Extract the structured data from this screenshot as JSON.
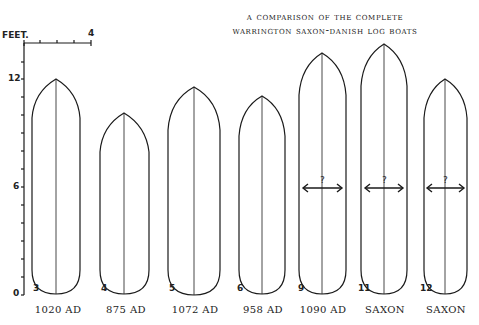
{
  "title": {
    "line1": "A Comparison of the Complete",
    "line2": "Warrington Saxon-Danish Log Boats"
  },
  "scale_bar": {
    "unit_label": "FEET.",
    "end_label": "4",
    "ticks": [
      0,
      1,
      2,
      3,
      4
    ]
  },
  "y_axis": {
    "labels": [
      "12",
      "6",
      "0"
    ],
    "unit": "feet",
    "range": [
      0,
      12
    ]
  },
  "boats": [
    {
      "number": "3",
      "date": "1020 AD",
      "length_ft": 12.0,
      "beam_known": true
    },
    {
      "number": "4",
      "date": "875 AD",
      "length_ft": 10.1,
      "beam_known": true
    },
    {
      "number": "5",
      "date": "1072 AD",
      "length_ft": 11.5,
      "beam_known": true
    },
    {
      "number": "6",
      "date": "958 AD",
      "length_ft": 11.0,
      "beam_known": true
    },
    {
      "number": "9",
      "date": "1090 AD",
      "length_ft": 13.3,
      "beam_known": false,
      "beam_label": "?"
    },
    {
      "number": "11",
      "date": "SAXON",
      "length_ft": 13.8,
      "beam_known": false,
      "beam_label": "?"
    },
    {
      "number": "12",
      "date": "SAXON",
      "length_ft": 12.0,
      "beam_known": false,
      "beam_label": "?"
    }
  ],
  "colors": {
    "ink": "#1a1a1a",
    "background": "#ffffff"
  }
}
